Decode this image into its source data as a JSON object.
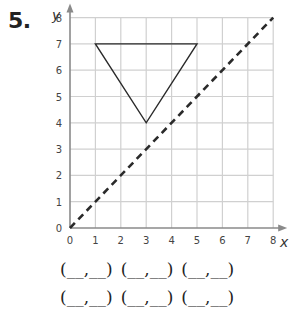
{
  "problem_number": "5.",
  "axes": {
    "x_label": "x",
    "y_label": "y"
  },
  "answer_blanks": [
    [
      "(__,__)",
      "(__,__)",
      "(__,__)"
    ],
    [
      "(__,__)",
      "(__,__)",
      "(__,__)"
    ]
  ],
  "chart_data": {
    "type": "line",
    "title": "",
    "xlabel": "x",
    "ylabel": "y",
    "xlim": [
      0,
      8
    ],
    "ylim": [
      0,
      8
    ],
    "x_ticks": [
      0,
      1,
      2,
      3,
      4,
      5,
      6,
      7,
      8
    ],
    "y_ticks": [
      0,
      1,
      2,
      3,
      4,
      5,
      6,
      7,
      8
    ],
    "grid": true,
    "series": [
      {
        "name": "triangle",
        "style": "solid",
        "closed": true,
        "points": [
          [
            1,
            7
          ],
          [
            5,
            7
          ],
          [
            3,
            4
          ]
        ]
      },
      {
        "name": "line of reflection y = x",
        "style": "dashed",
        "points": [
          [
            0,
            0
          ],
          [
            8,
            8
          ]
        ]
      }
    ]
  }
}
